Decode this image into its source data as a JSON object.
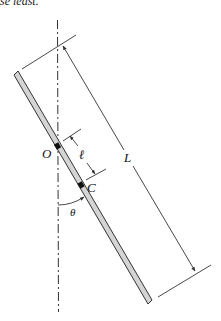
{
  "header": {
    "partial_text": "se least."
  },
  "diagram": {
    "labels": {
      "pivot": "O",
      "center_of_mass": "C",
      "rod_length": "L",
      "pivot_to_cm": "ℓ",
      "angle": "θ"
    },
    "colors": {
      "rod_fill": "#d4d4d4",
      "rod_outline": "#333333",
      "line": "#333333",
      "point": "#111111"
    }
  }
}
